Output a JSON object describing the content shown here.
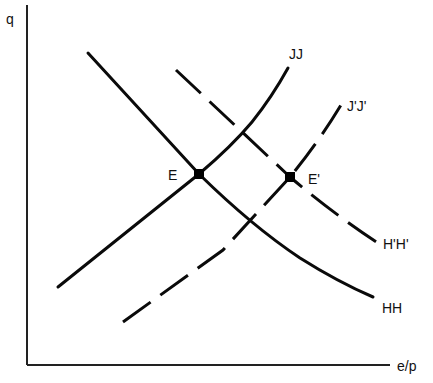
{
  "diagram": {
    "axes": {
      "y_label": "q",
      "x_label": "e/p"
    },
    "curves": [
      {
        "id": "HH",
        "label": "HH",
        "style": "solid",
        "slope": "downward"
      },
      {
        "id": "JJ",
        "label": "JJ",
        "style": "solid",
        "slope": "upward"
      },
      {
        "id": "HpHp",
        "label": "H'H'",
        "style": "dashed",
        "slope": "downward"
      },
      {
        "id": "JpJp",
        "label": "J'J'",
        "style": "dashed",
        "slope": "upward"
      }
    ],
    "points": [
      {
        "id": "E",
        "label": "E",
        "on": [
          "HH",
          "JJ"
        ]
      },
      {
        "id": "Ep",
        "label": "E'",
        "on": [
          "H'H'",
          "J'J'"
        ]
      }
    ],
    "colors": {
      "line": "#0a0a0a",
      "background": "#ffffff"
    }
  }
}
